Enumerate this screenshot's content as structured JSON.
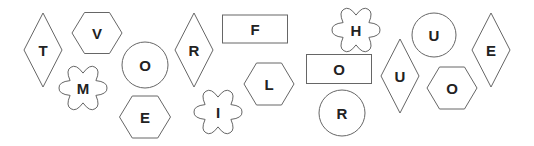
{
  "tiles": [
    {
      "letter": "T",
      "shape": "diamond",
      "cx": 43,
      "cy": 50,
      "w": 38,
      "h": 74
    },
    {
      "letter": "V",
      "shape": "hexagon",
      "cx": 97,
      "cy": 33,
      "w": 50,
      "h": 41
    },
    {
      "letter": "O",
      "shape": "circle",
      "cx": 145,
      "cy": 65,
      "r": 23
    },
    {
      "letter": "M",
      "shape": "flower",
      "cx": 83,
      "cy": 88,
      "r": 24
    },
    {
      "letter": "E",
      "shape": "hexagon",
      "cx": 145,
      "cy": 117,
      "w": 51,
      "h": 42
    },
    {
      "letter": "R",
      "shape": "diamond",
      "cx": 194,
      "cy": 50,
      "w": 38,
      "h": 74
    },
    {
      "letter": "F",
      "shape": "rectangle",
      "cx": 255,
      "cy": 29,
      "w": 65,
      "h": 28
    },
    {
      "letter": "L",
      "shape": "hexagon",
      "cx": 269,
      "cy": 84,
      "w": 50,
      "h": 42
    },
    {
      "letter": "I",
      "shape": "flower",
      "cx": 218,
      "cy": 112,
      "r": 24
    },
    {
      "letter": "H",
      "shape": "flower",
      "cx": 356,
      "cy": 30,
      "r": 24
    },
    {
      "letter": "O",
      "shape": "rectangle",
      "cx": 339,
      "cy": 69,
      "w": 65,
      "h": 29
    },
    {
      "letter": "R",
      "shape": "circle",
      "cx": 342,
      "cy": 113,
      "r": 23
    },
    {
      "letter": "U",
      "shape": "diamond",
      "cx": 400,
      "cy": 76,
      "w": 38,
      "h": 74
    },
    {
      "letter": "U",
      "shape": "circle",
      "cx": 434,
      "cy": 35,
      "r": 22
    },
    {
      "letter": "O",
      "shape": "hexagon",
      "cx": 452,
      "cy": 88,
      "w": 50,
      "h": 42
    },
    {
      "letter": "E",
      "shape": "diamond",
      "cx": 491,
      "cy": 50,
      "w": 38,
      "h": 74
    }
  ],
  "colors": {
    "stroke": "#666666",
    "text": "#222222",
    "background": "#ffffff"
  }
}
